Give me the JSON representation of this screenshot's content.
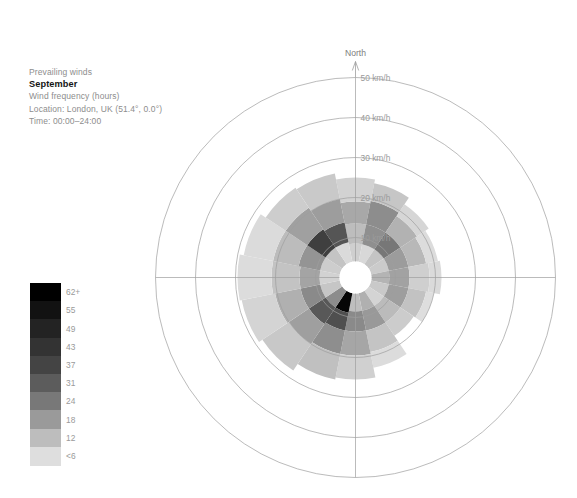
{
  "caption": {
    "line1": "Prevailing winds",
    "title": "September",
    "line3": "Wind frequency (hours)",
    "line4": "Location: London, UK (51.4°, 0.0°)",
    "line5": "Time: 00:00–24:00"
  },
  "legend": {
    "labels": [
      "62+",
      "55",
      "49",
      "43",
      "37",
      "31",
      "24",
      "18",
      "12",
      "<6"
    ],
    "colors": [
      "#000000",
      "#121212",
      "#232323",
      "#333333",
      "#444444",
      "#5c5c5c",
      "#787878",
      "#9a9a9a",
      "#bdbdbd",
      "#dedede"
    ]
  },
  "chart_data": {
    "type": "bar",
    "subtype": "wind-rose",
    "title": "September",
    "subtitle": "Prevailing winds",
    "ylabel": "Wind frequency (hours)",
    "location": "London, UK (51.4°, 0.0°)",
    "time_range": "00:00–24:00",
    "north_label": "North",
    "radial_axis": {
      "unit": "km/h",
      "tick_labels": [
        "10 km/h",
        "20 km/h",
        "30 km/h",
        "40 km/h",
        "50 km/h"
      ],
      "tick_values": [
        10,
        20,
        30,
        40,
        50
      ],
      "rmax": 50,
      "grid": true
    },
    "sector_count": 16,
    "sector_width_deg": 22.5,
    "directions": [
      "N",
      "NNE",
      "NE",
      "ENE",
      "E",
      "ESE",
      "SE",
      "SSE",
      "S",
      "SSW",
      "SW",
      "WSW",
      "W",
      "WNW",
      "NW",
      "NNW"
    ],
    "speed_bins": [
      "<6",
      "12",
      "18",
      "24",
      "31",
      "37",
      "43",
      "49",
      "55",
      "62+"
    ],
    "bin_colors": [
      "#dedede",
      "#bdbdbd",
      "#9a9a9a",
      "#787878",
      "#5c5c5c",
      "#444444",
      "#333333",
      "#232323",
      "#121212",
      "#000000"
    ],
    "series": [
      {
        "direction": "N",
        "segments": [
          {
            "bin": "<6",
            "from": 4.0,
            "to": 8.5,
            "color": "#cfcfcf"
          },
          {
            "bin": "12",
            "from": 8.5,
            "to": 13.5,
            "color": "#bdbdbd"
          },
          {
            "bin": "18",
            "from": 13.5,
            "to": 19.0,
            "color": "#a8a8a8"
          },
          {
            "bin": "24",
            "from": 19.0,
            "to": 25.0,
            "color": "#d2d2d2"
          }
        ]
      },
      {
        "direction": "NNE",
        "segments": [
          {
            "bin": "<6",
            "from": 4.0,
            "to": 8.5,
            "color": "#d8d8d8"
          },
          {
            "bin": "12",
            "from": 8.5,
            "to": 13.5,
            "color": "#8f8f8f"
          },
          {
            "bin": "18",
            "from": 13.5,
            "to": 19.5,
            "color": "#8d8d8d"
          },
          {
            "bin": "24",
            "from": 19.5,
            "to": 24.0,
            "color": "#c6c6c6"
          }
        ]
      },
      {
        "direction": "NE",
        "segments": [
          {
            "bin": "<6",
            "from": 4.0,
            "to": 8.5,
            "color": "#c4c4c4"
          },
          {
            "bin": "12",
            "from": 8.5,
            "to": 13.5,
            "color": "#777777"
          },
          {
            "bin": "18",
            "from": 13.5,
            "to": 18.5,
            "color": "#b2b2b2"
          },
          {
            "bin": "24",
            "from": 18.5,
            "to": 22.0,
            "color": "#d6d6d6"
          }
        ]
      },
      {
        "direction": "ENE",
        "segments": [
          {
            "bin": "<6",
            "from": 4.0,
            "to": 8.5,
            "color": "#cbcbcb"
          },
          {
            "bin": "12",
            "from": 8.5,
            "to": 13.5,
            "color": "#9c9c9c"
          },
          {
            "bin": "18",
            "from": 13.5,
            "to": 18.0,
            "color": "#b8b8b8"
          },
          {
            "bin": "24",
            "from": 18.0,
            "to": 21.0,
            "color": "#dcdcdc"
          }
        ]
      },
      {
        "direction": "E",
        "segments": [
          {
            "bin": "<6",
            "from": 4.0,
            "to": 8.5,
            "color": "#b4b4b4"
          },
          {
            "bin": "12",
            "from": 8.5,
            "to": 13.5,
            "color": "#a2a2a2"
          },
          {
            "bin": "18",
            "from": 13.5,
            "to": 18.5,
            "color": "#cfcfcf"
          },
          {
            "bin": "24",
            "from": 18.5,
            "to": 21.5,
            "color": "#dadada"
          }
        ]
      },
      {
        "direction": "ESE",
        "segments": [
          {
            "bin": "<6",
            "from": 4.0,
            "to": 8.5,
            "color": "#c9c9c9"
          },
          {
            "bin": "12",
            "from": 8.5,
            "to": 13.5,
            "color": "#9e9e9e"
          },
          {
            "bin": "18",
            "from": 13.5,
            "to": 18.0,
            "color": "#c2c2c2"
          },
          {
            "bin": "24",
            "from": 18.0,
            "to": 20.0,
            "color": "#dedede"
          }
        ]
      },
      {
        "direction": "SE",
        "segments": [
          {
            "bin": "<6",
            "from": 4.0,
            "to": 8.5,
            "color": "#d4d4d4"
          },
          {
            "bin": "12",
            "from": 8.5,
            "to": 13.5,
            "color": "#bbbbbb"
          },
          {
            "bin": "18",
            "from": 13.5,
            "to": 17.5,
            "color": "#cccccc"
          }
        ]
      },
      {
        "direction": "SSE",
        "segments": [
          {
            "bin": "<6",
            "from": 4.0,
            "to": 8.5,
            "color": "#b0b0b0"
          },
          {
            "bin": "12",
            "from": 8.5,
            "to": 13.5,
            "color": "#999999"
          },
          {
            "bin": "18",
            "from": 13.5,
            "to": 19.0,
            "color": "#c4c4c4"
          },
          {
            "bin": "24",
            "from": 19.0,
            "to": 23.0,
            "color": "#dcdcdc"
          }
        ]
      },
      {
        "direction": "S",
        "segments": [
          {
            "bin": "<6",
            "from": 4.0,
            "to": 8.5,
            "color": "#bebebe"
          },
          {
            "bin": "12",
            "from": 8.5,
            "to": 13.5,
            "color": "#8a8a8a"
          },
          {
            "bin": "18",
            "from": 13.5,
            "to": 19.5,
            "color": "#a6a6a6"
          },
          {
            "bin": "24",
            "from": 19.5,
            "to": 25.5,
            "color": "#d0d0d0"
          }
        ]
      },
      {
        "direction": "SSW",
        "segments": [
          {
            "bin": "62+",
            "from": 4.0,
            "to": 9.0,
            "color": "#060606"
          },
          {
            "bin": "31",
            "from": 9.0,
            "to": 13.5,
            "color": "#4f4f4f"
          },
          {
            "bin": "18",
            "from": 13.5,
            "to": 19.5,
            "color": "#8e8e8e"
          },
          {
            "bin": "12",
            "from": 19.5,
            "to": 26.0,
            "color": "#c0c0c0"
          }
        ]
      },
      {
        "direction": "SW",
        "segments": [
          {
            "bin": "18",
            "from": 4.0,
            "to": 9.0,
            "color": "#8c8c8c"
          },
          {
            "bin": "31",
            "from": 9.0,
            "to": 14.0,
            "color": "#585858"
          },
          {
            "bin": "24",
            "from": 14.0,
            "to": 20.0,
            "color": "#9f9f9f"
          },
          {
            "bin": "12",
            "from": 20.0,
            "to": 28.0,
            "color": "#c8c8c8"
          }
        ]
      },
      {
        "direction": "WSW",
        "segments": [
          {
            "bin": "12",
            "from": 4.0,
            "to": 9.0,
            "color": "#c6c6c6"
          },
          {
            "bin": "24",
            "from": 9.0,
            "to": 14.0,
            "color": "#8a8a8a"
          },
          {
            "bin": "18",
            "from": 14.0,
            "to": 20.5,
            "color": "#b0b0b0"
          },
          {
            "bin": "12",
            "from": 20.5,
            "to": 29.0,
            "color": "#d4d4d4"
          }
        ]
      },
      {
        "direction": "W",
        "segments": [
          {
            "bin": "<6",
            "from": 4.0,
            "to": 9.0,
            "color": "#d2d2d2"
          },
          {
            "bin": "18",
            "from": 9.0,
            "to": 14.0,
            "color": "#a4a4a4"
          },
          {
            "bin": "12",
            "from": 14.0,
            "to": 21.0,
            "color": "#c3c3c3"
          },
          {
            "bin": "<6",
            "from": 21.0,
            "to": 29.5,
            "color": "#dcdcdc"
          }
        ]
      },
      {
        "direction": "WNW",
        "segments": [
          {
            "bin": "<6",
            "from": 4.0,
            "to": 9.0,
            "color": "#cdcdcd"
          },
          {
            "bin": "24",
            "from": 9.0,
            "to": 14.5,
            "color": "#949494"
          },
          {
            "bin": "18",
            "from": 14.5,
            "to": 21.0,
            "color": "#bcbcbc"
          },
          {
            "bin": "<6",
            "from": 21.0,
            "to": 28.5,
            "color": "#dbdbdb"
          }
        ]
      },
      {
        "direction": "NW",
        "segments": [
          {
            "bin": "<6",
            "from": 4.0,
            "to": 9.0,
            "color": "#c4c4c4"
          },
          {
            "bin": "37",
            "from": 9.0,
            "to": 14.5,
            "color": "#3f3f3f"
          },
          {
            "bin": "24",
            "from": 14.5,
            "to": 21.0,
            "color": "#a0a0a0"
          },
          {
            "bin": "12",
            "from": 21.0,
            "to": 27.0,
            "color": "#cdcdcd"
          }
        ]
      },
      {
        "direction": "NNW",
        "segments": [
          {
            "bin": "<6",
            "from": 4.0,
            "to": 9.0,
            "color": "#dadada"
          },
          {
            "bin": "31",
            "from": 9.0,
            "to": 14.0,
            "color": "#555555"
          },
          {
            "bin": "24",
            "from": 14.0,
            "to": 20.0,
            "color": "#9d9d9d"
          },
          {
            "bin": "12",
            "from": 20.0,
            "to": 26.5,
            "color": "#c9c9c9"
          }
        ]
      }
    ]
  }
}
